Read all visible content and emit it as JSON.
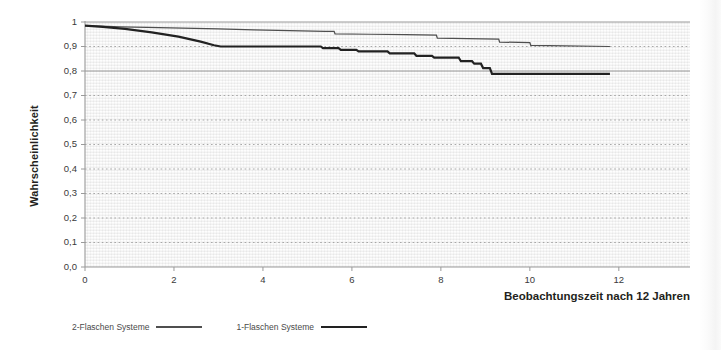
{
  "chart_data": {
    "type": "line",
    "title": "",
    "xlabel": "Beobachtungszeit nach 12 Jahren",
    "ylabel": "Wahrscheinlichkeit",
    "xlim": [
      0,
      13.6
    ],
    "ylim": [
      0.0,
      1.0
    ],
    "grid": true,
    "legend_position": "bottom-left",
    "xticks": [
      "0",
      "2",
      "4",
      "6",
      "8",
      "10",
      "12"
    ],
    "xtick_values": [
      0,
      2,
      4,
      6,
      8,
      10,
      12
    ],
    "yticks": [
      "0,0",
      "0,1",
      "0,2",
      "0,3",
      "0,4",
      "0,5",
      "0,6",
      "0,7",
      "0,8",
      "0,9",
      "1"
    ],
    "ytick_values": [
      0.0,
      0.1,
      0.2,
      0.3,
      0.4,
      0.5,
      0.6,
      0.7,
      0.8,
      0.9,
      1.0
    ],
    "series": [
      {
        "name": "2-Flaschen Systeme",
        "style": "thin",
        "color": "#4f4f4f",
        "x": [
          0.0,
          0.35,
          0.8,
          1.4,
          2.2,
          3.0,
          3.8,
          4.6,
          5.4,
          5.6,
          5.62,
          6.4,
          7.2,
          7.9,
          7.92,
          8.6,
          9.3,
          9.32,
          10.0,
          10.02,
          10.8,
          11.8
        ],
        "y": [
          0.985,
          0.983,
          0.98,
          0.978,
          0.975,
          0.972,
          0.968,
          0.965,
          0.962,
          0.962,
          0.952,
          0.95,
          0.948,
          0.946,
          0.934,
          0.932,
          0.93,
          0.918,
          0.916,
          0.905,
          0.903,
          0.9
        ]
      },
      {
        "name": "1-Flaschen Systeme",
        "style": "thick",
        "color": "#222222",
        "x": [
          0.0,
          0.4,
          0.9,
          1.5,
          2.1,
          2.6,
          2.9,
          3.05,
          5.3,
          5.35,
          5.7,
          5.75,
          6.1,
          6.15,
          6.8,
          6.85,
          7.4,
          7.45,
          7.8,
          7.85,
          8.4,
          8.45,
          8.7,
          8.75,
          8.9,
          8.95,
          9.1,
          9.15,
          11.8
        ],
        "y": [
          0.985,
          0.98,
          0.972,
          0.958,
          0.94,
          0.92,
          0.905,
          0.9,
          0.9,
          0.893,
          0.893,
          0.886,
          0.886,
          0.88,
          0.88,
          0.872,
          0.872,
          0.862,
          0.862,
          0.855,
          0.855,
          0.84,
          0.84,
          0.83,
          0.83,
          0.812,
          0.812,
          0.788,
          0.788
        ]
      }
    ]
  },
  "legend": {
    "items": [
      {
        "label": "2-Flaschen Systeme",
        "style": "thin"
      },
      {
        "label": "1-Flaschen Systeme",
        "style": "thick"
      }
    ]
  },
  "colors": {
    "axis": "#9a9a9a",
    "gridline_solid": "#8e8e8e",
    "gridline_dotted": "#9e9e9e",
    "series_thin": "#4f4f4f",
    "series_thick": "#222222",
    "text": "#231f20"
  }
}
